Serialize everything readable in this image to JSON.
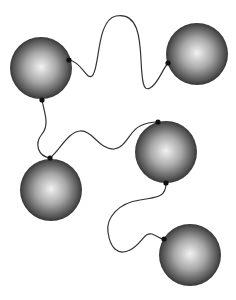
{
  "diagram": {
    "type": "network",
    "colors": {
      "background": "#ffffff",
      "sphere_highlight": "#f2f2f2",
      "sphere_mid": "#8a8a8a",
      "sphere_edge": "#1e1e1e",
      "string": "#333333",
      "node_dot": "#111111"
    },
    "spheres": [
      {
        "id": "s1",
        "cx": 41,
        "cy": 68,
        "r": 31
      },
      {
        "id": "s2",
        "cx": 197,
        "cy": 54,
        "r": 31
      },
      {
        "id": "s3",
        "cx": 166,
        "cy": 152,
        "r": 31
      },
      {
        "id": "s4",
        "cx": 51,
        "cy": 190,
        "r": 31
      },
      {
        "id": "s5",
        "cx": 190,
        "cy": 255,
        "r": 31
      }
    ],
    "connections": [
      {
        "from": "s1",
        "to": "s2",
        "path": "M69,60 C82,62 86,80 92,76 C100,70 96,20 116,16 C138,12 140,38 141,60 C142,80 143,92 150,88 C158,84 162,70 168,63"
      },
      {
        "from": "s1",
        "to": "s4",
        "path": "M42,100 C44,112 50,124 42,134 C34,144 38,156 50,158"
      },
      {
        "from": "s4",
        "to": "s3",
        "path": "M50,158 C60,150 68,132 80,131 C92,130 100,150 114,149 C126,148 130,130 140,126 C146,123 152,122 158,122"
      },
      {
        "from": "s3",
        "to": "s5",
        "path": "M166,183 C166,196 160,197 140,200 C118,203 106,218 108,232 C110,248 118,256 130,250 C142,244 144,232 152,234 C158,236 160,239 164,239"
      }
    ],
    "dots": [
      {
        "x": 69,
        "y": 60
      },
      {
        "x": 42,
        "y": 100
      },
      {
        "x": 168,
        "y": 63
      },
      {
        "x": 158,
        "y": 122
      },
      {
        "x": 166,
        "y": 183
      },
      {
        "x": 50,
        "y": 158
      },
      {
        "x": 164,
        "y": 239
      }
    ]
  }
}
